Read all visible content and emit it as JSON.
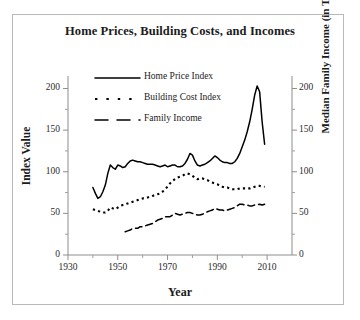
{
  "chart_data": {
    "type": "line",
    "title": "Home Prices, Building Costs, and Incomes",
    "xlabel": "Year",
    "ylabel": "Index Value",
    "ylabel_right": "Median Family Income (in Thousands)",
    "xlim": [
      1930,
      2020
    ],
    "ylim": [
      0,
      215
    ],
    "xticks": [
      1930,
      1950,
      1970,
      1990,
      2010
    ],
    "xticks_minor": [
      1940,
      1960,
      1980,
      2000
    ],
    "yticks": [
      0,
      50,
      100,
      150,
      200
    ],
    "yticks_right": [
      0,
      50,
      100,
      150,
      200
    ],
    "grid": false,
    "legend_position": "upper-left-inside",
    "series": [
      {
        "name": "Home Price Index",
        "style": "solid",
        "x": [
          1940,
          1941,
          1942,
          1943,
          1944,
          1945,
          1946,
          1947,
          1948,
          1949,
          1950,
          1951,
          1952,
          1953,
          1954,
          1955,
          1956,
          1957,
          1958,
          1959,
          1960,
          1961,
          1962,
          1963,
          1964,
          1965,
          1966,
          1967,
          1968,
          1969,
          1970,
          1971,
          1972,
          1973,
          1974,
          1975,
          1976,
          1977,
          1978,
          1979,
          1980,
          1981,
          1982,
          1983,
          1984,
          1985,
          1986,
          1987,
          1988,
          1989,
          1990,
          1991,
          1992,
          1993,
          1994,
          1995,
          1996,
          1997,
          1998,
          1999,
          2000,
          2001,
          2002,
          2003,
          2004,
          2005,
          2006,
          2007,
          2008,
          2009
        ],
        "values": [
          81,
          74,
          68,
          70,
          76,
          84,
          98,
          108,
          105,
          103,
          108,
          107,
          105,
          106,
          110,
          113,
          114,
          113,
          112,
          112,
          111,
          110,
          109,
          109,
          109,
          108,
          107,
          106,
          107,
          108,
          106,
          107,
          108,
          108,
          106,
          106,
          107,
          110,
          115,
          122,
          120,
          113,
          108,
          107,
          108,
          109,
          111,
          113,
          116,
          119,
          117,
          114,
          112,
          111,
          111,
          110,
          110,
          112,
          116,
          122,
          130,
          138,
          148,
          160,
          175,
          192,
          203,
          196,
          160,
          133
        ]
      },
      {
        "name": "Building Cost Index",
        "style": "dotted",
        "x": [
          1940,
          1941,
          1942,
          1943,
          1944,
          1945,
          1946,
          1947,
          1948,
          1949,
          1950,
          1951,
          1952,
          1953,
          1954,
          1955,
          1956,
          1957,
          1958,
          1959,
          1960,
          1961,
          1962,
          1963,
          1964,
          1965,
          1966,
          1967,
          1968,
          1969,
          1970,
          1971,
          1972,
          1973,
          1974,
          1975,
          1976,
          1977,
          1978,
          1979,
          1980,
          1981,
          1982,
          1983,
          1984,
          1985,
          1986,
          1987,
          1988,
          1989,
          1990,
          1991,
          1992,
          1993,
          1994,
          1995,
          1996,
          1997,
          1998,
          1999,
          2000,
          2001,
          2002,
          2003,
          2004,
          2005,
          2006,
          2007,
          2008,
          2009
        ],
        "values": [
          55,
          54,
          53,
          52,
          51,
          51,
          53,
          57,
          56,
          55,
          57,
          59,
          60,
          61,
          62,
          63,
          64,
          65,
          66,
          67,
          68,
          68,
          69,
          70,
          71,
          72,
          73,
          74,
          76,
          79,
          82,
          86,
          89,
          91,
          93,
          94,
          95,
          97,
          98,
          97,
          95,
          93,
          91,
          92,
          92,
          91,
          90,
          88,
          87,
          86,
          85,
          83,
          82,
          81,
          81,
          80,
          79,
          79,
          79,
          80,
          80,
          80,
          80,
          80,
          81,
          82,
          83,
          83,
          82,
          82
        ]
      },
      {
        "name": "Family Income",
        "style": "dashed",
        "x": [
          1953,
          1954,
          1955,
          1956,
          1957,
          1958,
          1959,
          1960,
          1961,
          1962,
          1963,
          1964,
          1965,
          1966,
          1967,
          1968,
          1969,
          1970,
          1971,
          1972,
          1973,
          1974,
          1975,
          1976,
          1977,
          1978,
          1979,
          1980,
          1981,
          1982,
          1983,
          1984,
          1985,
          1986,
          1987,
          1988,
          1989,
          1990,
          1991,
          1992,
          1993,
          1994,
          1995,
          1996,
          1997,
          1998,
          1999,
          2000,
          2001,
          2002,
          2003,
          2004,
          2005,
          2006,
          2007,
          2008,
          2009
        ],
        "values": [
          28,
          29,
          30,
          32,
          32,
          32,
          34,
          34,
          35,
          36,
          37,
          38,
          40,
          42,
          43,
          44,
          46,
          46,
          46,
          48,
          50,
          49,
          48,
          49,
          50,
          51,
          51,
          50,
          49,
          48,
          48,
          49,
          50,
          52,
          53,
          54,
          56,
          55,
          54,
          54,
          53,
          54,
          55,
          56,
          57,
          59,
          61,
          61,
          60,
          60,
          59,
          59,
          60,
          60,
          61,
          60,
          61
        ]
      }
    ]
  },
  "legend": {
    "items": [
      {
        "label": "Home Price Index",
        "style": "solid"
      },
      {
        "label": "Building Cost Index",
        "style": "dotted"
      },
      {
        "label": "Family Income",
        "style": "dashed"
      }
    ]
  },
  "axes": {
    "x_tick_labels": [
      "1930",
      "1950",
      "1970",
      "1990",
      "2010"
    ],
    "y_tick_labels_left": [
      "0",
      "50",
      "100",
      "150",
      "200"
    ],
    "y_tick_labels_right": [
      "0",
      "50",
      "100",
      "150",
      "200"
    ]
  },
  "colors": {
    "line": "#000000",
    "axis": "#8d8d8d",
    "text": "#1b1b1b",
    "border": "#b9b9b9",
    "background": "#ffffff"
  }
}
